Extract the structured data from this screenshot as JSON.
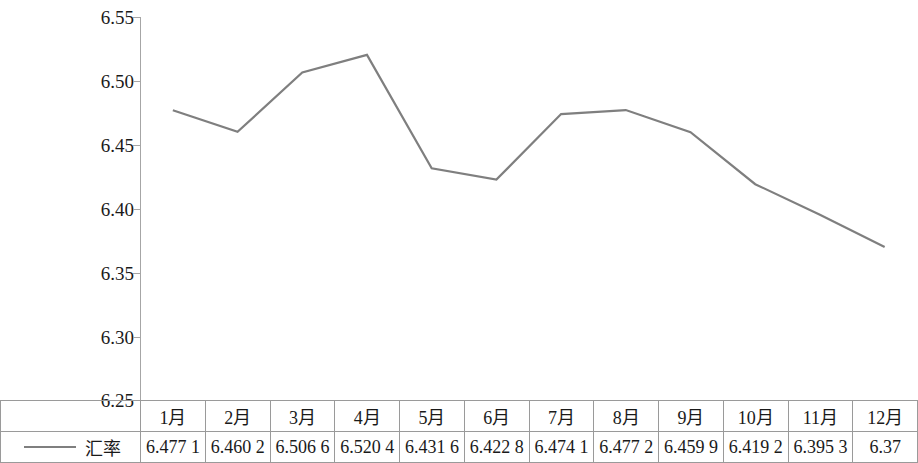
{
  "chart_data": {
    "type": "line",
    "title": "",
    "subtitle": "",
    "xlabel": "",
    "ylabel": "",
    "categories": [
      "1月",
      "2月",
      "3月",
      "4月",
      "5月",
      "6月",
      "7月",
      "8月",
      "9月",
      "10月",
      "11月",
      "12月"
    ],
    "series": [
      {
        "name": "汇率",
        "values": [
          6.4771,
          6.4602,
          6.5066,
          6.5204,
          6.4316,
          6.4228,
          6.4741,
          6.4772,
          6.4599,
          6.4192,
          6.3953,
          6.37
        ],
        "color": "#7f7f7f"
      }
    ],
    "value_labels": [
      "6.477 1",
      "6.460 2",
      "6.506 6",
      "6.520 4",
      "6.431 6",
      "6.422 8",
      "6.474 1",
      "6.477 2",
      "6.459 9",
      "6.419 2",
      "6.395 3",
      "6.37"
    ],
    "ylim": [
      6.25,
      6.55
    ],
    "y_ticks": [
      6.25,
      6.3,
      6.35,
      6.4,
      6.45,
      6.5,
      6.55
    ],
    "y_tick_labels": [
      "6.25",
      "6.30",
      "6.35",
      "6.40",
      "6.45",
      "6.50",
      "6.55"
    ],
    "grid": false,
    "legend_position": "bottom-left-table",
    "markers": false
  },
  "legend": {
    "series_label": "汇率"
  },
  "table": {
    "header_row": [
      "1月",
      "2月",
      "3月",
      "4月",
      "5月",
      "6月",
      "7月",
      "8月",
      "9月",
      "10月",
      "11月",
      "12月"
    ],
    "value_row": [
      "6.477 1",
      "6.460 2",
      "6.506 6",
      "6.520 4",
      "6.431 6",
      "6.422 8",
      "6.474 1",
      "6.477 2",
      "6.459 9",
      "6.419 2",
      "6.395 3",
      "6.37"
    ]
  },
  "axis": {
    "y_labels": [
      "6.55",
      "6.50",
      "6.45",
      "6.40",
      "6.35",
      "6.30",
      "6.25"
    ]
  }
}
